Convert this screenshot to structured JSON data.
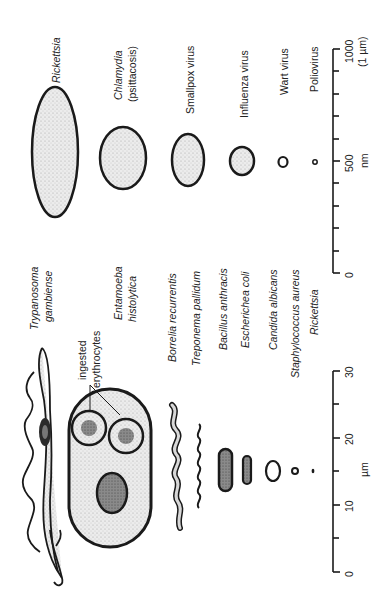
{
  "figure": {
    "orientation": "rotated-90-ccw",
    "stroke_color": "#1a1a1a",
    "fill_stipple": "#e6e6e6",
    "fill_dark": "#7a7a7a"
  },
  "nm_panel": {
    "organisms": [
      {
        "name": "Rickettsia",
        "italic": true
      },
      {
        "name": "Chlamydia",
        "italic": true,
        "sub": "(psittacosis)"
      },
      {
        "name": "Smallpox virus",
        "italic": false
      },
      {
        "name": "Influenza virus",
        "italic": false
      },
      {
        "name": "Wart virus",
        "italic": false
      },
      {
        "name": "Poliovirus",
        "italic": false
      }
    ],
    "scale": {
      "unit": "nm",
      "ticks": [
        "0",
        "500",
        "1000"
      ],
      "max_note": "(1 µm)",
      "minor_tick_step": 100
    }
  },
  "um_panel": {
    "organisms": [
      {
        "name": "Trypanosoma",
        "sub": "gambiense",
        "italic": true
      },
      {
        "name": "Entamoeba",
        "sub": "histolytica",
        "italic": true
      },
      {
        "name": "Borrelia recurrentis",
        "italic": true
      },
      {
        "name": "Treponema pallidum",
        "italic": true
      },
      {
        "name": "Bacillus anthracis",
        "italic": true
      },
      {
        "name": "Escherichea coli",
        "italic": true
      },
      {
        "name": "Candida albicans",
        "italic": true
      },
      {
        "name": "Staphylococcus aureus",
        "italic": true
      },
      {
        "name": "Rickettsia",
        "italic": true
      }
    ],
    "annotation": {
      "line1": "ingested",
      "line2": "erythrocytes"
    },
    "scale": {
      "unit": "µm",
      "ticks": [
        "0",
        "10",
        "20",
        "30"
      ],
      "minor_tick_step": 5
    }
  }
}
